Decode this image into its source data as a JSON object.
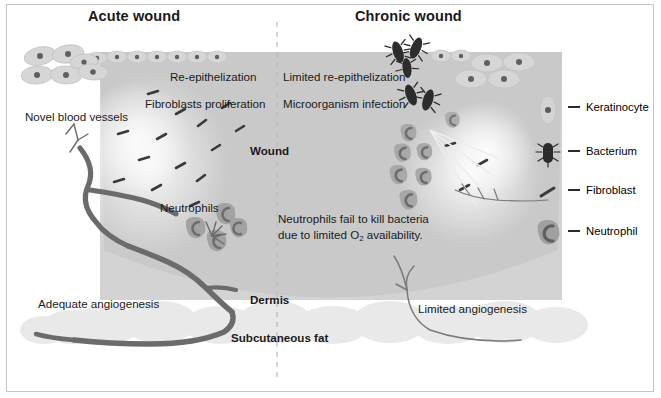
{
  "figure": {
    "kind": "scientific-diagram"
  },
  "titles": {
    "left": "Acute wound",
    "right": "Chronic wound"
  },
  "acute_labels": {
    "reepithelization": "Re-epithelization",
    "fibroblasts": "Fibroblasts proliferation",
    "vessels": "Novel blood vessels",
    "neutrophils": "Neutrophils",
    "angiogenesis": "Adequate angiogenesis"
  },
  "chronic_labels": {
    "reepithelization": "Limited re-epithelization",
    "infection": "Microorganism infection",
    "neutrophil_fail_line1": "Neutrophils fail to kill bacteria",
    "neutrophil_fail_line2_a": "due to limited O",
    "neutrophil_fail_line2_sub": "2",
    "neutrophil_fail_line2_b": " availability.",
    "angiogenesis": "Limited angiogenesis"
  },
  "tissue_labels": {
    "wound": "Wound",
    "dermis": "Dermis",
    "subcutaneous_fat": "Subcutaneous fat"
  },
  "legend": {
    "items": [
      {
        "label": "Keratinocyte",
        "icon": "keratinocyte-icon"
      },
      {
        "label": "Bacterium",
        "icon": "bacterium-icon"
      },
      {
        "label": "Fibroblast",
        "icon": "fibroblast-icon"
      },
      {
        "label": "Neutrophil",
        "icon": "neutrophil-icon"
      }
    ]
  },
  "colors": {
    "wound_fill": "#c9c9c9",
    "dermis_fill": "#d4d4d4",
    "fat_fill": "#e8e8e8",
    "vessel_dark": "#6b6b6b",
    "vessel_thin": "#7a7a7a",
    "bacteria": "#2e2e2e",
    "neutrophil_body": "#9c9c9c",
    "neutrophil_nucleus": "#6d6d6d",
    "keratinocyte_fill": "#d9d9d9",
    "keratinocyte_nucleus": "#6a6a6a",
    "fibroblast": "#3a3a3a",
    "divider": "#b9b9b9",
    "text": "#1a1a1a",
    "frame": "#c4c4c4",
    "background": "#ffffff"
  }
}
